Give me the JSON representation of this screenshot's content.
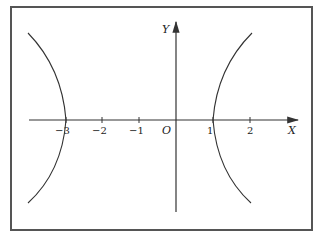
{
  "diagram": {
    "type": "hyperbola-plot",
    "axes": {
      "x_label": "X",
      "y_label": "Y",
      "origin_label": "O"
    },
    "x_ticks": [
      {
        "value": -3,
        "label": "−3"
      },
      {
        "value": -2,
        "label": "−2"
      },
      {
        "value": -1,
        "label": "−1"
      },
      {
        "value": 1,
        "label": "1"
      },
      {
        "value": 2,
        "label": "2"
      }
    ],
    "curve": {
      "description": "hyperbola opening left and right",
      "left_vertex_x": -3,
      "right_vertex_x": 1,
      "center_x": -1
    },
    "colors": {
      "frame": "#555555",
      "line": "#333333",
      "background": "#ffffff"
    }
  }
}
